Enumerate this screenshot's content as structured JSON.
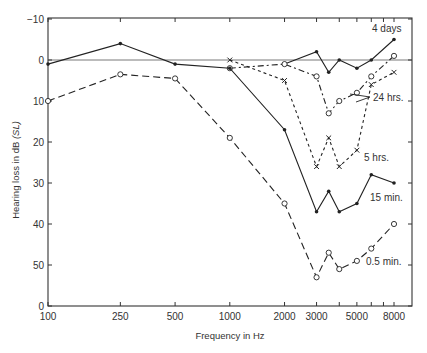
{
  "chart_data": {
    "type": "line",
    "title": "",
    "xlabel": "Frequency in Hz",
    "ylabel": "Hearing loss in dB",
    "ylabel_italic": "(SL)",
    "xscale": "log",
    "x_ticks": [
      100,
      250,
      500,
      1000,
      2000,
      3000,
      5000,
      8000
    ],
    "x_tick_labels": [
      "100",
      "250",
      "500",
      "1000",
      "2000",
      "3000",
      "5000",
      "8000"
    ],
    "x_minor_ticks": [
      4000,
      6000,
      7000
    ],
    "y_ticks": [
      -10,
      0,
      10,
      20,
      30,
      40,
      50,
      60
    ],
    "y_tick_labels": [
      "-10",
      "0",
      "10",
      "20",
      "30",
      "40",
      "50",
      "0"
    ],
    "ylim": [
      60,
      -10
    ],
    "y_inverted": true,
    "grid": false,
    "reference_line": 0,
    "legend": "inline labels",
    "series": [
      {
        "name": "4 days",
        "style": "solid",
        "marker": "dot",
        "x": [
          2000,
          3000,
          3500,
          4000,
          5000,
          6000,
          8000
        ],
        "y": [
          1,
          -2,
          3,
          0,
          2,
          0,
          -5
        ]
      },
      {
        "name": "24 hrs.",
        "style": "dashdot",
        "marker": "circle",
        "x": [
          1000,
          2000,
          3000,
          3500,
          4000,
          5000,
          6000,
          8000
        ],
        "y": [
          2,
          1,
          4,
          13,
          10,
          8,
          4,
          -1
        ]
      },
      {
        "name": "5 hrs.",
        "style": "shortdash",
        "marker": "x",
        "x": [
          1000,
          2000,
          3000,
          3500,
          4000,
          5000,
          6000,
          8000
        ],
        "y": [
          0,
          5,
          26,
          19,
          26,
          22,
          6,
          3
        ]
      },
      {
        "name": "15 min.",
        "style": "solid",
        "marker": "dot",
        "x": [
          100,
          250,
          500,
          1000,
          2000,
          3000,
          3500,
          4000,
          5000,
          6000,
          8000
        ],
        "y": [
          1,
          -4,
          1,
          2,
          17,
          37,
          32,
          37,
          35,
          28,
          30
        ]
      },
      {
        "name": "0.5 min.",
        "style": "longdash",
        "marker": "circle",
        "x": [
          100,
          250,
          500,
          1000,
          2000,
          3000,
          3500,
          4000,
          5000,
          6000,
          8000
        ],
        "y": [
          10,
          3.5,
          4.5,
          19,
          35,
          53,
          47,
          51,
          49,
          46,
          40
        ]
      }
    ]
  },
  "labels": {
    "series_4days": "4 days",
    "series_24hrs": "24 hrs.",
    "series_5hrs": "5 hrs.",
    "series_15min": "15 min.",
    "series_05min": "0.5 min."
  }
}
